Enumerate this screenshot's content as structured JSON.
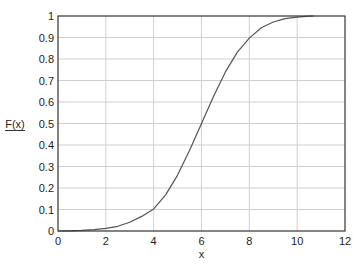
{
  "chart_data": {
    "type": "line",
    "title": "",
    "xlabel": "x",
    "ylabel": "F(x)",
    "xlim": [
      0,
      12
    ],
    "ylim": [
      0,
      1
    ],
    "xticks": [
      0,
      2,
      4,
      6,
      8,
      10,
      12
    ],
    "yticks": [
      0,
      0.1,
      0.2,
      0.3,
      0.4,
      0.5,
      0.6,
      0.7,
      0.8,
      0.9,
      1
    ],
    "ytick_labels": [
      "0",
      "0.1",
      "0.2",
      "0.3",
      "0.4",
      "0.5",
      "0.6",
      "0.7",
      "0.8",
      "0.9",
      "1"
    ],
    "grid": true,
    "legend": null,
    "series": [
      {
        "name": "F(x)",
        "color": "#555555",
        "x": [
          0,
          0.5,
          1,
          1.5,
          2,
          2.5,
          3,
          3.5,
          4,
          4.5,
          5,
          5.5,
          6,
          6.5,
          7,
          7.5,
          8,
          8.5,
          9,
          9.5,
          10,
          10.5,
          10.7
        ],
        "y": [
          0.0,
          0.001,
          0.003,
          0.006,
          0.012,
          0.022,
          0.041,
          0.068,
          0.103,
          0.168,
          0.26,
          0.375,
          0.5,
          0.625,
          0.74,
          0.832,
          0.897,
          0.945,
          0.972,
          0.988,
          0.995,
          0.999,
          1.0
        ]
      }
    ]
  },
  "colors": {
    "axis": "#333333",
    "grid": "#cfcfcf",
    "line": "#555555"
  }
}
